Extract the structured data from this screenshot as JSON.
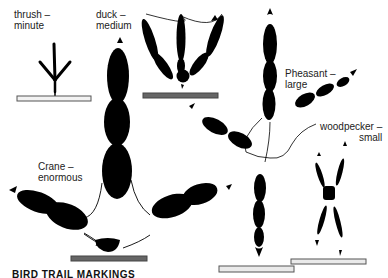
{
  "figure": {
    "caption": "BIRD TRAIL MARKINGS",
    "colors": {
      "ink": "#000000",
      "background": "#ffffff",
      "scale_bar_dark": "#555555",
      "scale_bar_light": "#e8e8e8"
    },
    "tracks": [
      {
        "name": "thrush",
        "size": "minute",
        "label_line1": "thrush –",
        "label_line2": "minute"
      },
      {
        "name": "duck",
        "size": "medium",
        "label_line1": "duck –",
        "label_line2": "medium"
      },
      {
        "name": "pheasant",
        "size": "large",
        "label_line1": "Pheasant –",
        "label_line2": "large"
      },
      {
        "name": "crane",
        "size": "enormous",
        "label_line1": "Crane –",
        "label_line2": "enormous"
      },
      {
        "name": "woodpecker",
        "size": "small",
        "label_line1": "woodpecker –",
        "label_line2": "small"
      }
    ]
  }
}
